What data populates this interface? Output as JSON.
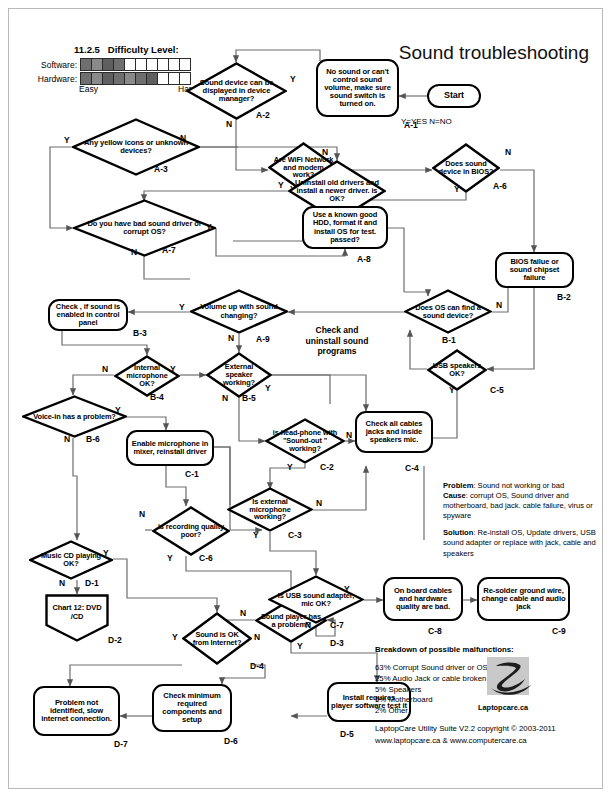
{
  "header": {
    "title": "Sound troubleshooting",
    "version": "11.2.5",
    "difficulty_title": "Difficulty Level:",
    "software_label": "Software:",
    "hardware_label": "Hardware:",
    "easy_label": "Easy",
    "hard_label": "Hard",
    "software_filled": 4,
    "hardware_filled": 7,
    "scale_cells": 10,
    "legend": "Y=YES N=NO"
  },
  "nodes": {
    "start": {
      "id": "",
      "text": "Start"
    },
    "a1": {
      "id": "A-1",
      "text": "No sound or can't control sound volume, make sure sound switch is turned on."
    },
    "a2": {
      "id": "A-2",
      "text": "Sound device can be displayed in device manager?"
    },
    "a3": {
      "id": "A-3",
      "text": "Any yellow icons or unknown devices?"
    },
    "a4": {
      "id": "A-4",
      "text": "Are WiFi Network and modem work?"
    },
    "a5": {
      "id": "A-5",
      "text": "Uninstall old drivers and install a newer driver. is OK?"
    },
    "a6": {
      "id": "A-6",
      "text": "Does sound device in BIOS?"
    },
    "a7": {
      "id": "A-7",
      "text": "Do you have bad sound driver or corrupt OS?"
    },
    "a8": {
      "id": "A-8",
      "text": "Use a known good HDD, format it and install OS for test. passed?"
    },
    "a9": {
      "id": "A-9",
      "text": "Volume up with sound changing?"
    },
    "b1": {
      "id": "B-1",
      "text": "Does OS can find a sound device?"
    },
    "b2": {
      "id": "B-2",
      "text": "BIOS failue or sound chipset failure"
    },
    "b3": {
      "id": "B-3",
      "text": "Check , if sound is enabled in control panel"
    },
    "b4": {
      "id": "B-4",
      "text": "Internal microphone OK?"
    },
    "b5": {
      "id": "B-5",
      "text": "External speaker working?"
    },
    "b6": {
      "id": "B-6",
      "text": "Voice-in has a problem?"
    },
    "c1": {
      "id": "C-1",
      "text": "Enable microphone in mixer, reinstall driver"
    },
    "c2": {
      "id": "C-2",
      "text": "is head-phone with \"Sound-out \" working?"
    },
    "c3": {
      "id": "C-3",
      "text": "Is external microphone working?"
    },
    "c4": {
      "id": "C-4",
      "text": "Check all cables jacks and inside speakers mic."
    },
    "c5": {
      "id": "C-5",
      "text": "USB speakers OK?"
    },
    "c6": {
      "id": "C-6",
      "text": "is recording quality poor?"
    },
    "c7": {
      "id": "C-7",
      "text": "Is USB sound adapter, mic OK?"
    },
    "c8": {
      "id": "C-8",
      "text": "On board cables and hardware quality are bad."
    },
    "c9": {
      "id": "C-9",
      "text": "Re-solder ground wire, change cable and audio jack"
    },
    "d1": {
      "id": "D-1",
      "text": "Music CD playing OK?"
    },
    "d2": {
      "id": "D-2",
      "text": "Chart 12: DVD /CD"
    },
    "d3": {
      "id": "D-3",
      "text": "Sound player has a problem?"
    },
    "d4": {
      "id": "D-4",
      "text": "Sound is OK from Internet?"
    },
    "d5": {
      "id": "D-5",
      "text": "Install requires player software test it"
    },
    "d6": {
      "id": "D-6",
      "text": "Check minimum required components and setup"
    },
    "d7": {
      "id": "D-7",
      "text": "Problem not identified, slow internet connection."
    }
  },
  "note": "Check and uninstall sound programs",
  "branch_labels": {
    "a2_y": "Y",
    "a2_n": "N",
    "a3_y": "Y",
    "a3_n": "N",
    "a4_y": "Y",
    "a4_n": "N",
    "a5_y": "Y",
    "a5_n": "N",
    "a6_y": "Y",
    "a6_n": "N",
    "a7_y": "Y",
    "a7_n": "N",
    "a9_y": "Y",
    "a9_n": "N",
    "b1_n": "N",
    "b4_y": "Y",
    "b4_n": "N",
    "b5_y": "Y",
    "b5_n": "N",
    "b6_y": "Y",
    "b6_n": "N",
    "c2_y": "Y",
    "c2_n": "N",
    "c3_y": "Y",
    "c3_n": "N",
    "c5_y": "Y",
    "c6_y": "Y",
    "c6_n": "N",
    "c7_y": "Y",
    "c7_n": "N",
    "d1_y": "Y",
    "d1_n": "N",
    "d3_y": "Y",
    "d3_n": "N",
    "d4_y": "Y",
    "d4_n": "N"
  },
  "problem_cause_solution": {
    "problem_label": "Problem",
    "problem_text": ": Sound not working or bad",
    "cause_label": "Cause",
    "cause_text": ": corrupt OS, Sound driver and motherboard, bad jack. cable failure, virus or spyware",
    "solution_label": "Solution",
    "solution_text": ": Re-install OS, Update drivers, USB sound adapter or replace with jack, cable and speakers"
  },
  "breakdown": {
    "title": "Breakdown of possible malfunctions:",
    "items": [
      "63% Corrupt Sound driver or OS",
      "25% Audio Jack or cable broken",
      "5% Speakers",
      "5% Motherboard",
      "2% Other"
    ]
  },
  "logo_caption": "Laptopcare.ca",
  "footer": {
    "line1": "LaptopCare Utility Suite V2.2 copyright © 2003-2011",
    "line2": "www.laptopcare.ca & www.computercare.ca"
  }
}
